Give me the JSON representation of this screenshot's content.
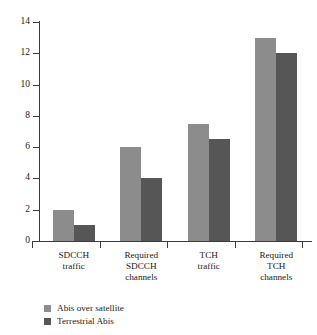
{
  "chart_data": {
    "type": "bar",
    "title": "",
    "xlabel": "",
    "ylabel": "",
    "ylim": [
      0,
      14
    ],
    "yticks": [
      0,
      2,
      4,
      6,
      8,
      10,
      12,
      14
    ],
    "grid": false,
    "legend_position": "bottom-left",
    "categories": [
      "SDCCH traffic",
      "Required SDCCH channels",
      "TCH traffic",
      "Required TCH channels"
    ],
    "category_lines": [
      [
        "SDCCH",
        "traffic"
      ],
      [
        "Required",
        "SDCCH",
        "channels"
      ],
      [
        "TCH",
        "traffic"
      ],
      [
        "Required",
        "TCH",
        "channels"
      ]
    ],
    "series": [
      {
        "name": "Abis over satellite",
        "color": "#8c8c8c",
        "values": [
          2,
          6,
          7.5,
          13
        ]
      },
      {
        "name": "Terrestrial Abis",
        "color": "#565656",
        "values": [
          1,
          4,
          6.5,
          12
        ]
      }
    ]
  },
  "colors": {
    "axis": "#3b3b3b",
    "text": "#1a1a1a",
    "background": "#ffffff",
    "series_light": "#8c8c8c",
    "series_dark": "#565656"
  }
}
